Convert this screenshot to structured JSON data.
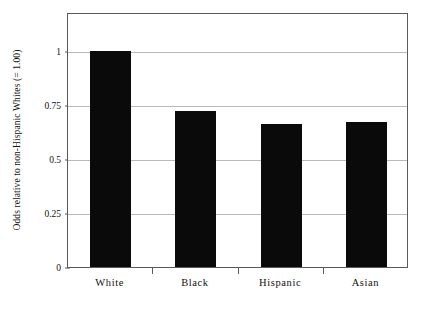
{
  "chart_data": {
    "type": "bar",
    "title": "",
    "subtitle": "",
    "xlabel": "",
    "ylabel": "Odds relative to non-Hispanic Whites (= 1.00)",
    "categories": [
      "White",
      "Black",
      "Hispanic",
      "Asian"
    ],
    "values": [
      1.0,
      0.72,
      0.66,
      0.67
    ],
    "series": [
      {
        "name": "Odds ratio",
        "values": [
          1.0,
          0.72,
          0.66,
          0.67
        ]
      }
    ],
    "ylim": [
      0,
      1.18
    ],
    "yticks": [
      0,
      0.25,
      0.5,
      0.75,
      1
    ],
    "ytick_labels": [
      "0",
      "0.25",
      "0.5",
      "0.75",
      "1"
    ],
    "grid": true,
    "grid_axis": "y",
    "legend": false,
    "legend_position": "none",
    "bar_color": "#0a0a0a",
    "grid_color": "#b9b9b9",
    "frame_color": "#5a5a5a",
    "background_color": "#ffffff",
    "annotations": []
  }
}
